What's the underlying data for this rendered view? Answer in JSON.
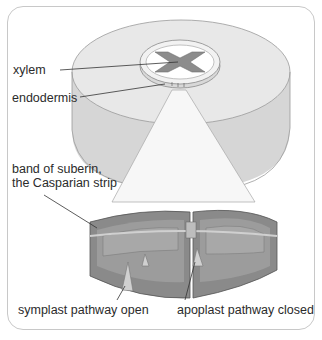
{
  "diagram": {
    "labels": {
      "xylem": "xylem",
      "endodermis": "endodermis",
      "casparian_line1": "band of suberin,",
      "casparian_line2": "the Casparian strip",
      "symplast": "symplast pathway open",
      "apoplast": "apoplast pathway closed"
    },
    "colors": {
      "frame": "#c8c8c8",
      "disc_top": "#e6e6e6",
      "disc_side": "#d2d2d2",
      "xylem": "#8c8c8c",
      "cell_wall": "#8a8a8a",
      "cell_inner": "#a5a5a5",
      "arrow": "#cfcfcf",
      "leader_line": "#333333"
    }
  }
}
